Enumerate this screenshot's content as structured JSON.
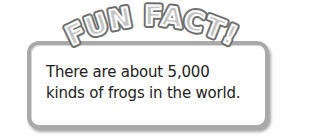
{
  "banner": {
    "title": "FUN FACT!"
  },
  "fact": {
    "line1": "There are about 5,000",
    "line2": "kinds of frogs in the world."
  },
  "colors": {
    "border": "#a9a9a9",
    "banner_fill": "#bdbdbd",
    "banner_outline": "#6e6e6e",
    "text": "#222222"
  }
}
